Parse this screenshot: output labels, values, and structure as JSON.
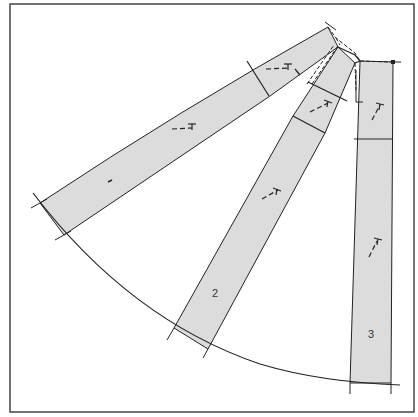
{
  "diagram": {
    "type": "pattern-drafting",
    "colors": {
      "frame": "#444444",
      "strip_fill": "#dcdcdc",
      "line": "#222222",
      "background": "#ffffff"
    },
    "strips": [
      {
        "id": "strip-1",
        "label": "1",
        "grain_marks": 3,
        "cross_lines": 1
      },
      {
        "id": "strip-2",
        "label": "2",
        "grain_marks": 2,
        "cross_lines": 2
      },
      {
        "id": "strip-3",
        "label": "3",
        "grain_marks": 2,
        "cross_lines": 1
      }
    ],
    "hem_curve": "arc through bottoms of strips 1, 2 and 3"
  }
}
